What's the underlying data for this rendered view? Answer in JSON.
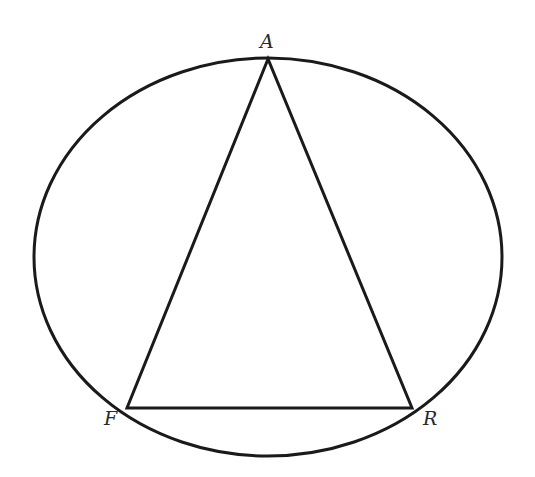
{
  "diagram": {
    "type": "inscribed-triangle-in-ellipse",
    "stroke_color": "#1a1a1a",
    "label_color": "#2a2a2a",
    "ellipse": {
      "cx": 268,
      "cy": 257,
      "rx": 234,
      "ry": 199
    },
    "vertices": [
      {
        "name": "A",
        "x": 268,
        "y": 59,
        "label_x": 260,
        "label_y": 48
      },
      {
        "name": "F",
        "x": 127,
        "y": 408,
        "label_x": 104,
        "label_y": 425
      },
      {
        "name": "R",
        "x": 412,
        "y": 408,
        "label_x": 423,
        "label_y": 425
      }
    ],
    "labels": {
      "A": "A",
      "F": "F",
      "R": "R"
    }
  }
}
